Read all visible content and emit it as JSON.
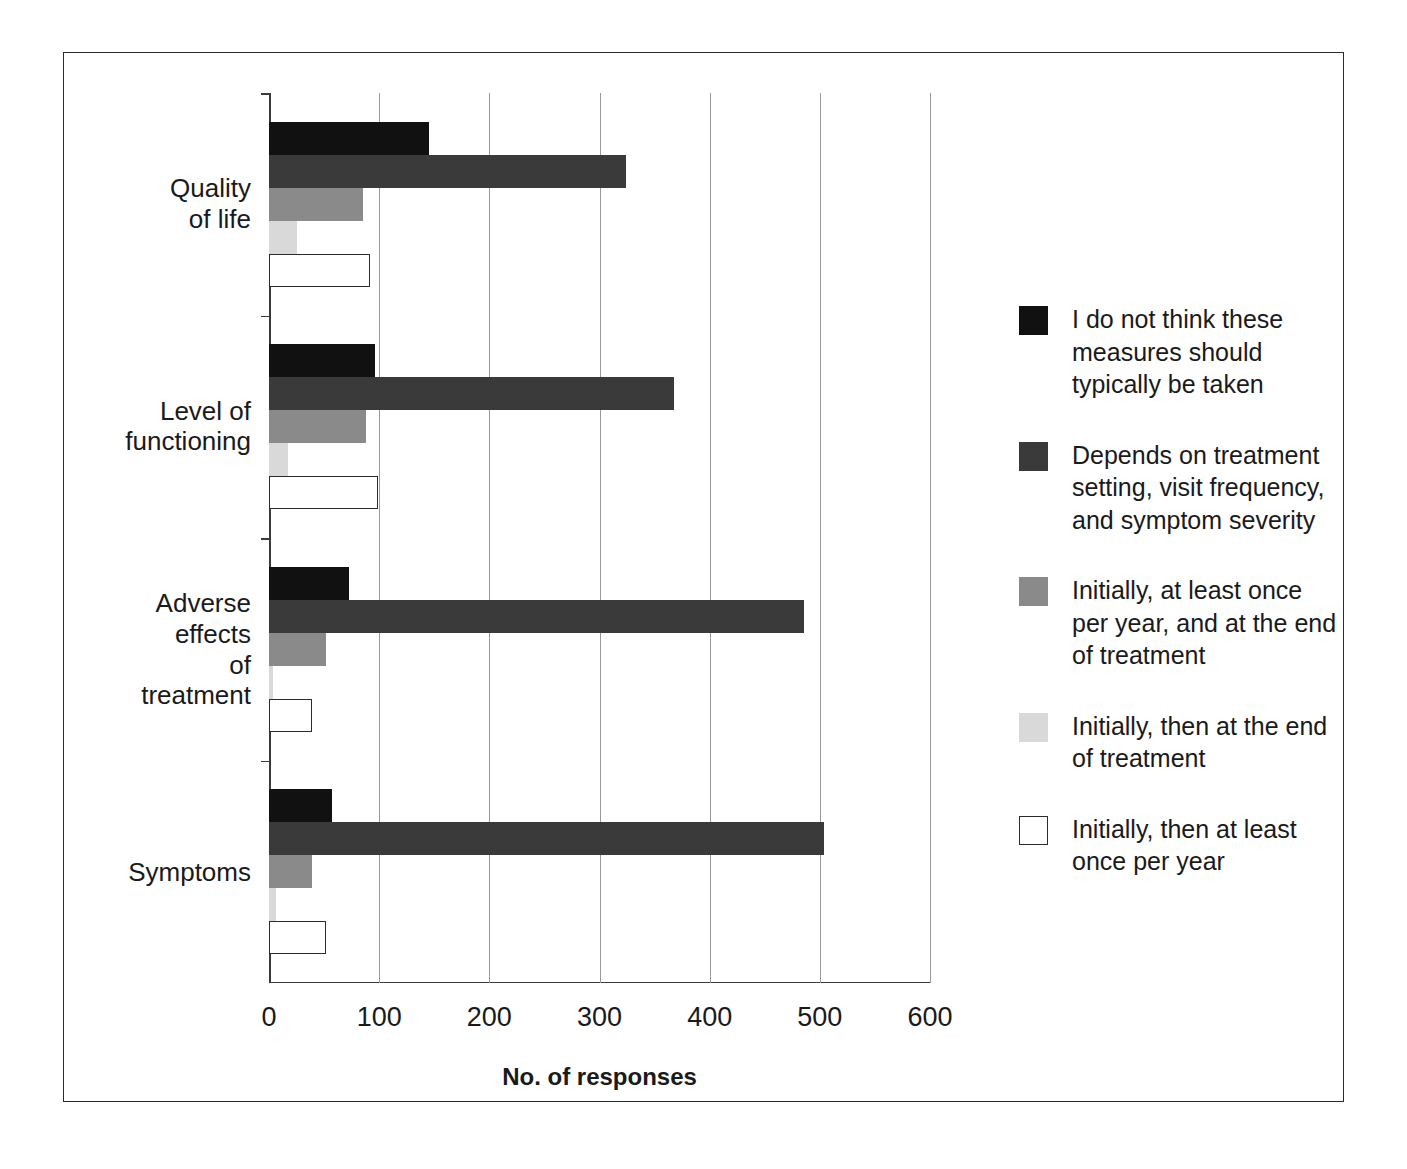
{
  "chart_data": {
    "type": "bar",
    "orientation": "horizontal",
    "title": "",
    "xlabel": "No. of responses",
    "ylabel": "",
    "xlim": [
      0,
      600
    ],
    "xticks": [
      0,
      100,
      200,
      300,
      400,
      500,
      600
    ],
    "grid": "vertical",
    "legend_position": "right",
    "categories": [
      "Quality of life",
      "Level of functioning",
      "Adverse effects\nof treatment",
      "Symptoms"
    ],
    "series": [
      {
        "name": "I do not think these measures should typically be taken",
        "color": "#111111",
        "values": [
          145,
          96,
          73,
          57
        ]
      },
      {
        "name": "Depends on treatment setting, visit frequency, and symptom severity",
        "color": "#3a3a3a",
        "values": [
          324,
          368,
          486,
          504
        ]
      },
      {
        "name": "Initially, at least once per year, and at the end of treatment",
        "color": "#8a8a8a",
        "values": [
          85,
          88,
          52,
          39
        ]
      },
      {
        "name": "Initially, then at the end of treatment",
        "color": "#d9d9d9",
        "values": [
          25,
          17,
          4,
          6
        ]
      },
      {
        "name": "Initially, then at least once per year",
        "color": "#ffffff",
        "values": [
          92,
          99,
          39,
          52
        ]
      }
    ]
  },
  "axis": {
    "x_title": "No. of responses",
    "tick_labels": [
      "0",
      "100",
      "200",
      "300",
      "400",
      "500",
      "600"
    ]
  },
  "legend": {
    "items": [
      {
        "label": "I do not think these measures should typically be taken",
        "swatch": "black-swatch-icon"
      },
      {
        "label": "Depends on treatment setting, visit frequency, and symptom severity",
        "swatch": "dark-gray-swatch-icon"
      },
      {
        "label": "Initially, at least once per year, and at the end of treatment",
        "swatch": "medium-gray-swatch-icon"
      },
      {
        "label": "Initially, then at the end of treatment",
        "swatch": "light-gray-swatch-icon"
      },
      {
        "label": "Initially, then at least once per year",
        "swatch": "white-swatch-icon"
      }
    ]
  }
}
